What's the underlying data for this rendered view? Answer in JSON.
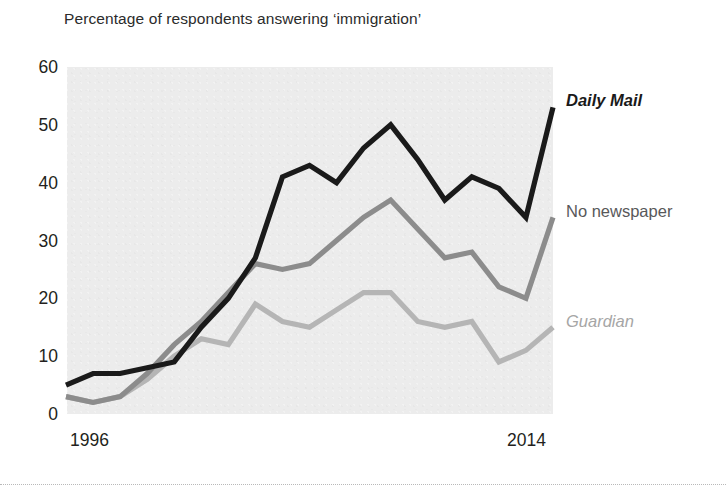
{
  "chart_data": {
    "type": "line",
    "title": "Percentage of respondents answering ‘immigration’",
    "xlabel": "",
    "ylabel": "",
    "ylim": [
      0,
      60
    ],
    "xlim": [
      1996,
      2014
    ],
    "grid": false,
    "legend_position": "right-inline",
    "ytick_labels": [
      "60",
      "50",
      "40",
      "30",
      "20",
      "10",
      "0"
    ],
    "ytick_values": [
      60,
      50,
      40,
      30,
      20,
      10,
      0
    ],
    "xtick_labels": [
      "1996",
      "2014"
    ],
    "xtick_values": [
      1996,
      2014
    ],
    "x": [
      1996,
      1997,
      1998,
      1999,
      2000,
      2001,
      2002,
      2003,
      2004,
      2005,
      2006,
      2007,
      2008,
      2009,
      2010,
      2011,
      2012,
      2013,
      2014
    ],
    "series": [
      {
        "name": "Daily Mail",
        "color": "#1a1a1a",
        "style": "italic",
        "label_value": 53,
        "values": [
          5,
          7,
          7,
          8,
          9,
          15,
          20,
          27,
          41,
          43,
          40,
          46,
          50,
          44,
          37,
          41,
          39,
          34,
          53
        ]
      },
      {
        "name": "No newspaper",
        "color": "#8c8c8c",
        "style": "normal",
        "label_value": 34,
        "values": [
          3,
          2,
          3,
          7,
          12,
          16,
          21,
          26,
          25,
          26,
          30,
          34,
          37,
          32,
          27,
          28,
          22,
          20,
          34
        ]
      },
      {
        "name": "Guardian",
        "color": "#b5b5b5",
        "style": "italic",
        "label_value": 15,
        "values": [
          3,
          2,
          3,
          6,
          10,
          13,
          12,
          19,
          16,
          15,
          18,
          21,
          21,
          16,
          15,
          16,
          9,
          11,
          15
        ]
      }
    ]
  },
  "colors": {
    "plot_background": "#ececec",
    "page_background": "#ffffff",
    "text": "#231f20",
    "daily_mail": "#1a1a1a",
    "no_newspaper": "#8c8c8c",
    "guardian": "#b5b5b5",
    "rule": "#b9b9b9"
  },
  "labels": {
    "daily_mail": "Daily Mail",
    "no_newspaper": "No newspaper",
    "guardian": "Guardian"
  }
}
